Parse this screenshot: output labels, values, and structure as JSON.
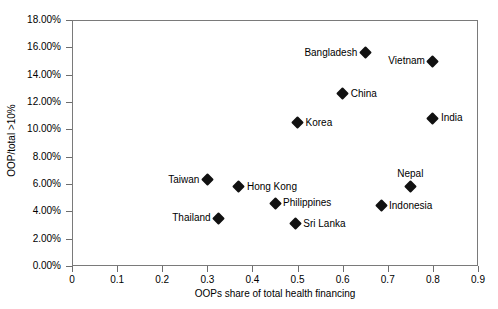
{
  "chart_data": {
    "type": "scatter",
    "title": "",
    "xlabel": "OOPs share of total health financing",
    "ylabel": "OOP/total >10%",
    "xlim": [
      0,
      0.9
    ],
    "ylim": [
      0,
      0.18
    ],
    "grid": false,
    "legend": "none",
    "xticks": [
      "0",
      "0.1",
      "0.2",
      "0.3",
      "0.4",
      "0.5",
      "0.6",
      "0.7",
      "0.8",
      "0.9"
    ],
    "xtick_values": [
      0,
      0.1,
      0.2,
      0.3,
      0.4,
      0.5,
      0.6,
      0.7,
      0.8,
      0.9
    ],
    "yticks": [
      "0.00%",
      "2.00%",
      "4.00%",
      "6.00%",
      "8.00%",
      "10.00%",
      "12.00%",
      "14.00%",
      "16.00%",
      "18.00%"
    ],
    "ytick_values": [
      0,
      0.02,
      0.04,
      0.06,
      0.08,
      0.1,
      0.12,
      0.14,
      0.16,
      0.18
    ],
    "marker": "diamond",
    "marker_color": "#111111",
    "points": [
      {
        "name": "Bangladesh",
        "x": 0.65,
        "y": 0.156,
        "label_pos": "left"
      },
      {
        "name": "Vietnam",
        "x": 0.8,
        "y": 0.15,
        "label_pos": "left"
      },
      {
        "name": "China",
        "x": 0.6,
        "y": 0.126,
        "label_pos": "right"
      },
      {
        "name": "India",
        "x": 0.8,
        "y": 0.108,
        "label_pos": "right"
      },
      {
        "name": "Korea",
        "x": 0.5,
        "y": 0.105,
        "label_pos": "right"
      },
      {
        "name": "Taiwan",
        "x": 0.3,
        "y": 0.063,
        "label_pos": "left"
      },
      {
        "name": "Hong Kong",
        "x": 0.37,
        "y": 0.058,
        "label_pos": "right"
      },
      {
        "name": "Nepal",
        "x": 0.75,
        "y": 0.058,
        "label_pos": "above"
      },
      {
        "name": "Philippines",
        "x": 0.45,
        "y": 0.046,
        "label_pos": "right"
      },
      {
        "name": "Indonesia",
        "x": 0.685,
        "y": 0.044,
        "label_pos": "right"
      },
      {
        "name": "Thailand",
        "x": 0.325,
        "y": 0.035,
        "label_pos": "left"
      },
      {
        "name": "Sri Lanka",
        "x": 0.495,
        "y": 0.031,
        "label_pos": "right"
      }
    ]
  }
}
